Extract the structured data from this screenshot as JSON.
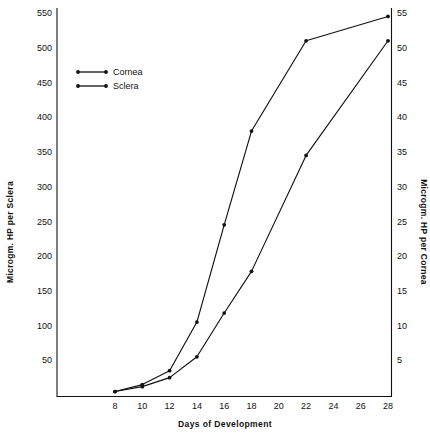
{
  "chart_data": {
    "type": "line",
    "title": "",
    "xlabel": "Days of Development",
    "ylabel": "Microgm. HP per Sclera",
    "ylabel_right": "Microgm. HP per Cornea",
    "x": [
      8,
      10,
      12,
      14,
      16,
      18,
      22,
      28
    ],
    "xlim": [
      8,
      28
    ],
    "ylim": [
      0,
      550
    ],
    "ylim_right": [
      0,
      55
    ],
    "grid": false,
    "legend_position": "upper-left",
    "xticks": [
      8,
      10,
      12,
      14,
      16,
      18,
      20,
      22,
      24,
      26,
      28
    ],
    "xtick_labels": [
      "8",
      "10",
      "12",
      "14",
      "16",
      "18",
      "20",
      "22",
      "24",
      "26",
      "28"
    ],
    "yticks": [
      50,
      100,
      150,
      200,
      250,
      300,
      350,
      400,
      450,
      500,
      550
    ],
    "ytick_labels": [
      "50",
      "100",
      "150",
      "200",
      "250",
      "300",
      "350",
      "400",
      "450",
      "500",
      "550"
    ],
    "yticks_right": [
      5,
      10,
      15,
      20,
      25,
      30,
      35,
      40,
      45,
      50,
      55
    ],
    "ytick_labels_right": [
      "5",
      "10",
      "15",
      "20",
      "25",
      "30",
      "35",
      "40",
      "45",
      "50",
      "55"
    ],
    "series": [
      {
        "name": "Cornea",
        "axis": "right",
        "x": [
          8,
          10,
          12,
          14,
          16,
          18,
          22,
          28
        ],
        "values": [
          0.5,
          1.5,
          3.5,
          10.5,
          24.5,
          38.0,
          51.0,
          54.5
        ]
      },
      {
        "name": "Sclera",
        "axis": "left",
        "x": [
          8,
          10,
          12,
          14,
          16,
          18,
          22,
          28
        ],
        "values": [
          5,
          12,
          25,
          55,
          118,
          178,
          345,
          510
        ]
      }
    ]
  },
  "legend": {
    "items": [
      {
        "label": "Cornea"
      },
      {
        "label": "Sclera"
      }
    ]
  },
  "axes": {
    "x_title": "Days of Development",
    "y_left_title": "Microgm. HP per Sclera",
    "y_right_title": "Microgm. HP per Cornea"
  }
}
